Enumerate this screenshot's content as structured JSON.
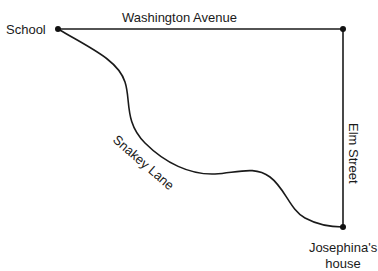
{
  "places": {
    "school": "School",
    "home_line1": "Josephina's",
    "home_line2": "house"
  },
  "roads": {
    "top": "Washington Avenue",
    "right": "Elm Street",
    "curvy": "Snakey Lane"
  },
  "colors": {
    "ink": "#1a1a1a",
    "background": "#ffffff"
  }
}
